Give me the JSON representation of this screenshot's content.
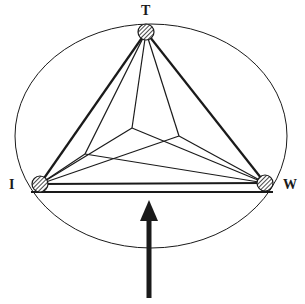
{
  "diagram": {
    "type": "ternary-triangle-with-interior-nodes",
    "colors": {
      "stroke": "#1a1a1a",
      "background": "#ffffff",
      "node_fill": "#8a8a8a"
    },
    "ellipse": {
      "cx": 151,
      "cy": 136,
      "rx": 136,
      "ry": 112
    },
    "vertices": [
      {
        "id": "T",
        "label": "T",
        "x": 146,
        "y": 32,
        "label_x": 141,
        "label_y": 15
      },
      {
        "id": "I",
        "label": "I",
        "x": 40,
        "y": 184,
        "label_x": 9,
        "label_y": 189
      },
      {
        "id": "W",
        "label": "W",
        "x": 265,
        "y": 183,
        "label_x": 283,
        "label_y": 189
      }
    ],
    "interior_nodes": [
      {
        "id": "left",
        "x": 85,
        "y": 154
      },
      {
        "id": "center",
        "x": 132,
        "y": 128
      },
      {
        "id": "right",
        "x": 179,
        "y": 136
      }
    ],
    "triangle_edges": [
      [
        "T",
        "I"
      ],
      [
        "T",
        "W"
      ],
      [
        "I",
        "W"
      ]
    ],
    "interior_edges": [
      [
        "T",
        "left"
      ],
      [
        "T",
        "center"
      ],
      [
        "T",
        "right"
      ],
      [
        "I",
        "left"
      ],
      [
        "I",
        "center"
      ],
      [
        "I",
        "right"
      ],
      [
        "W",
        "left"
      ],
      [
        "W",
        "center"
      ],
      [
        "W",
        "right"
      ]
    ],
    "baseline": {
      "x1": 31,
      "y1": 192,
      "x2": 273,
      "y2": 192
    },
    "arrow": {
      "direction": "up",
      "tip_x": 149,
      "tip_y": 200,
      "head_half_width": 9,
      "head_length": 21,
      "shaft_bottom_y": 298,
      "shaft_width": 5
    }
  }
}
